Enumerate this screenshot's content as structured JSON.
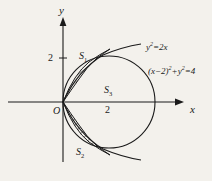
{
  "figure": {
    "background_color": "#f3f1ec",
    "ink_color": "#1a1a1a",
    "width": 212,
    "height": 181
  },
  "axes": {
    "x_label": "x",
    "y_label": "y",
    "origin_label": "O",
    "y_tick_label": "2",
    "x_tick_label": "2"
  },
  "curves": {
    "parabola": {
      "label_text": "y",
      "label_sup": "2",
      "label_rest": "=2x",
      "equation": "y²=2x"
    },
    "circle": {
      "label_open": "(x−2)",
      "label_sup1": "2",
      "label_mid": "+y",
      "label_sup2": "2",
      "label_end": "=4",
      "equation": "(x−2)²+y²=4"
    }
  },
  "regions": [
    {
      "name": "S",
      "subscript": "1",
      "full": "S₁"
    },
    {
      "name": "S",
      "subscript": "2",
      "full": "S₂"
    },
    {
      "name": "S",
      "subscript": "3",
      "full": "S₃"
    }
  ]
}
